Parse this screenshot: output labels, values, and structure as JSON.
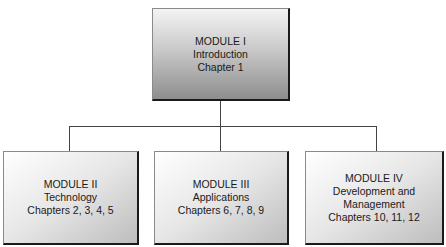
{
  "diagram": {
    "type": "org-chart",
    "root": {
      "lines": [
        "MODULE I",
        "Introduction",
        "Chapter 1"
      ]
    },
    "children": [
      {
        "lines": [
          "MODULE II",
          "Technology",
          "Chapters 2, 3, 4, 5"
        ]
      },
      {
        "lines": [
          "MODULE III",
          "Applications",
          "Chapters 6, 7, 8, 9"
        ]
      },
      {
        "lines": [
          "MODULE IV",
          "Development and",
          "Management",
          "Chapters 10, 11, 12"
        ]
      }
    ]
  }
}
